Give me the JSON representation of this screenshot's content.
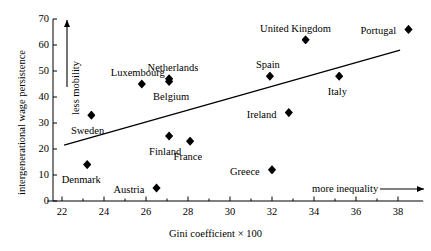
{
  "chart_data": {
    "type": "scatter",
    "title": "",
    "xlabel": "Gini coefficient × 100",
    "ylabel": "intergenerational wage persistence",
    "xlim": [
      21.3,
      39.2
    ],
    "ylim": [
      0,
      70
    ],
    "xticks": [
      22,
      24,
      26,
      28,
      30,
      32,
      34,
      36,
      38
    ],
    "xtick_labels": [
      "22",
      "24",
      "26",
      "28",
      "30",
      "32",
      "34",
      "36",
      "38"
    ],
    "xminorticks": [
      23,
      25,
      27,
      29,
      31,
      33,
      35,
      37
    ],
    "yticks": [
      0,
      10,
      20,
      30,
      40,
      50,
      60,
      70
    ],
    "ytick_labels": [
      "0",
      "10",
      "20",
      "30",
      "40",
      "50",
      "60",
      "70"
    ],
    "grid": false,
    "legend": null,
    "marker": "diamond",
    "marker_color": "#000000",
    "points": [
      {
        "name": "Denmark",
        "x": 23.2,
        "y": 14,
        "label_dx": -6,
        "label_dy": 15,
        "label_anchor": "middle"
      },
      {
        "name": "Sweden",
        "x": 23.4,
        "y": 33,
        "label_dx": -4,
        "label_dy": 16,
        "label_anchor": "middle"
      },
      {
        "name": "Luxembourg",
        "x": 25.8,
        "y": 45,
        "label_dx": -4,
        "label_dy": -11,
        "label_anchor": "middle"
      },
      {
        "name": "Austria",
        "x": 26.5,
        "y": 5,
        "label_dx": -12,
        "label_dy": 2,
        "label_anchor": "end"
      },
      {
        "name": "Finland",
        "x": 27.1,
        "y": 25,
        "label_dx": -4,
        "label_dy": 16,
        "label_anchor": "middle"
      },
      {
        "name": "Netherlands",
        "x": 27.1,
        "y": 47,
        "label_dx": 4,
        "label_dy": -11,
        "label_anchor": "middle"
      },
      {
        "name": "Belgium",
        "x": 27.1,
        "y": 46,
        "label_dx": 2,
        "label_dy": 16,
        "label_anchor": "middle"
      },
      {
        "name": "France",
        "x": 28.1,
        "y": 23,
        "label_dx": -2,
        "label_dy": 16,
        "label_anchor": "middle"
      },
      {
        "name": "Greece",
        "x": 32.0,
        "y": 12,
        "label_dx": -12,
        "label_dy": 2,
        "label_anchor": "end"
      },
      {
        "name": "Spain",
        "x": 31.9,
        "y": 48,
        "label_dx": -2,
        "label_dy": -11,
        "label_anchor": "middle"
      },
      {
        "name": "Ireland",
        "x": 32.8,
        "y": 34,
        "label_dx": -12,
        "label_dy": 2,
        "label_anchor": "end"
      },
      {
        "name": "United Kingdom",
        "x": 33.6,
        "y": 62,
        "label_dx": -10,
        "label_dy": -11,
        "label_anchor": "middle"
      },
      {
        "name": "Italy",
        "x": 35.2,
        "y": 48,
        "label_dx": -2,
        "label_dy": 16,
        "label_anchor": "middle"
      },
      {
        "name": "Portugal",
        "x": 38.5,
        "y": 66,
        "label_dx": -12,
        "label_dy": 2,
        "label_anchor": "end"
      }
    ],
    "trendline": {
      "x1": 22.1,
      "y1": 21.5,
      "x2": 38.1,
      "y2": 58.0
    },
    "annotations": [
      {
        "name": "less-mobility",
        "text": "less mobility",
        "orientation": "vertical",
        "arrow": "up"
      },
      {
        "name": "more-inequality",
        "text": "more inequality",
        "orientation": "horizontal",
        "arrow": "right"
      }
    ]
  }
}
